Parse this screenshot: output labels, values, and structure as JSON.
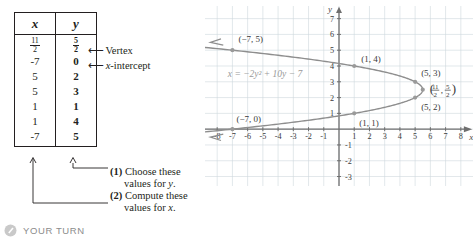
{
  "table": {
    "headers": [
      "x",
      "y"
    ],
    "rows": [
      {
        "x": "11/2",
        "x_num": "11",
        "x_den": "2",
        "x_is_fraction": true,
        "y": "5/2",
        "y_num": "5",
        "y_den": "2",
        "y_is_fraction": true,
        "y_bold": true
      },
      {
        "x": "-7",
        "x_is_fraction": false,
        "y": "0",
        "y_is_fraction": false,
        "y_bold": true
      },
      {
        "x": "5",
        "x_is_fraction": false,
        "y": "2",
        "y_is_fraction": false,
        "y_bold": true
      },
      {
        "x": "5",
        "x_is_fraction": false,
        "y": "3",
        "y_is_fraction": false,
        "y_bold": true
      },
      {
        "x": "1",
        "x_is_fraction": false,
        "y": "1",
        "y_is_fraction": false,
        "y_bold": true
      },
      {
        "x": "1",
        "x_is_fraction": false,
        "y": "4",
        "y_is_fraction": false,
        "y_bold": true
      },
      {
        "x": "-7",
        "x_is_fraction": false,
        "y": "5",
        "y_is_fraction": false,
        "y_bold": true
      }
    ]
  },
  "annotations": {
    "arrow_glyph": "⟵",
    "vertex_label": "Vertex",
    "xintercept_label_italic": "x",
    "xintercept_label_rest": "-intercept",
    "note1_number": "(1)",
    "note1_line1": "Choose these",
    "note1_line2_pre": "values for ",
    "note1_line2_var": "y",
    "note1_line2_post": ".",
    "note2_number": "(2)",
    "note2_line1": "Compute these",
    "note2_line2_pre": "values for ",
    "note2_line2_var": "x",
    "note2_line2_post": "."
  },
  "chart_data": {
    "type": "line",
    "title": "",
    "equation": "x = −2y² + 10y − 7",
    "equation_parts": {
      "lhs": "x",
      "eq": "=",
      "rhs": "−2y² + 10y − 7"
    },
    "xlabel": "x",
    "ylabel": "y",
    "xlim": [
      -8.8,
      8.8
    ],
    "ylim": [
      -3.6,
      7.8
    ],
    "xticks": [
      -8,
      -7,
      -6,
      -5,
      -4,
      -3,
      -2,
      -1,
      1,
      2,
      3,
      4,
      5,
      6,
      7,
      8
    ],
    "yticks": [
      -3,
      -2,
      -1,
      1,
      2,
      3,
      4,
      5,
      6,
      7
    ],
    "xtick_labels": [
      "-8",
      "-7",
      "-6",
      "-5",
      "-4",
      "-3",
      "-2",
      "-1",
      "1",
      "2",
      "3",
      "4",
      "5",
      "6",
      "7",
      "8"
    ],
    "ytick_labels": [
      "-3",
      "-2",
      "-1",
      "1",
      "2",
      "3",
      "4",
      "5",
      "6",
      "7"
    ],
    "grid": true,
    "legend": "none",
    "curve_color": "#8e8e8e",
    "axis_color": "#6f6f6f",
    "grid_color": "#cfd8dd",
    "point_color": "#9a9a9a",
    "vertex": {
      "x": 5.5,
      "y": 2.5,
      "label": "(11/2, 5/2)",
      "num1": "11",
      "den1": "2",
      "num2": "5",
      "den2": "2"
    },
    "points": [
      {
        "x": -7,
        "y": 5,
        "label": "(−7, 5)"
      },
      {
        "x": 1,
        "y": 4,
        "label": "(1, 4)"
      },
      {
        "x": 5,
        "y": 3,
        "label": "(5, 3)"
      },
      {
        "x": 5,
        "y": 2,
        "label": "(5, 2)"
      },
      {
        "x": 1,
        "y": 1,
        "label": "(1, 1)"
      },
      {
        "x": -7,
        "y": 0,
        "label": "(−7, 0)"
      }
    ],
    "curve_param": {
      "form": "x = a*y^2 + b*y + c",
      "a": -2,
      "b": 10,
      "c": -7,
      "y_from": -0.65,
      "y_to": 5.65
    }
  },
  "footer": {
    "your_turn_label": "YOUR TURN",
    "icon": "pencil-circle-icon"
  }
}
